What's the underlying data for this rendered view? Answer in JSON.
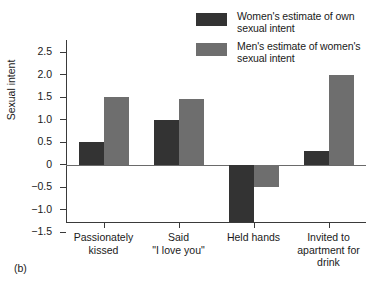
{
  "figure": {
    "caption": "(b)"
  },
  "chart_data": {
    "type": "bar",
    "title": "",
    "xlabel": "",
    "ylabel": "Sexual intent",
    "categories": [
      "Passionately kissed",
      "Said \"I love you\"",
      "Held hands",
      "Invited to apartment for drink"
    ],
    "category_lines": [
      [
        "Passionately",
        "kissed"
      ],
      [
        "Said",
        "\"I love you\""
      ],
      [
        "Held hands"
      ],
      [
        "Invited to",
        "apartment for",
        "drink"
      ]
    ],
    "series": [
      {
        "name": "Women's estimate of own sexual intent",
        "name_lines": [
          "Women's estimate of own",
          "sexual intent"
        ],
        "color": "#333333",
        "values": [
          0.5,
          1.0,
          -1.27,
          0.3
        ]
      },
      {
        "name": "Men's estimate of women's sexual intent",
        "name_lines": [
          "Men's estimate of women's",
          "sexual intent"
        ],
        "color": "#6e6e6e",
        "values": [
          1.5,
          1.45,
          -0.5,
          2.0
        ]
      }
    ],
    "ylim": [
      -1.5,
      2.75
    ],
    "yticks": [
      2.5,
      2.0,
      1.5,
      1.0,
      0.5,
      0,
      -0.5,
      -1.0,
      -1.5
    ],
    "ytick_labels": [
      "2.5",
      "2.0",
      "1.5",
      "1.0",
      "0.5",
      "0",
      "-0.5",
      "-1.0",
      "-1.5"
    ],
    "grid": false,
    "legend_position": "top-right"
  },
  "colors": {
    "series_dark": "#333333",
    "series_gray": "#6e6e6e",
    "axis": "#3a3a3a",
    "background": "#ffffff"
  }
}
